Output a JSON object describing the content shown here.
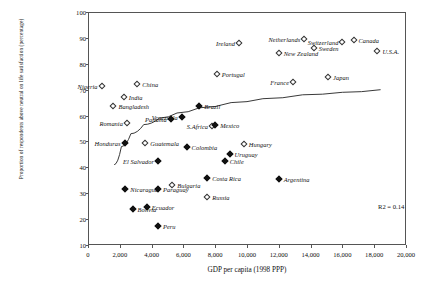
{
  "chart_data": {
    "type": "scatter",
    "title": "",
    "xlabel": "GDP per capita (1998 PPP)",
    "ylabel": "Proportion of respondents above neutral on life satisfaction (percentage)",
    "xlim": [
      0,
      20000
    ],
    "ylim": [
      10,
      100
    ],
    "xticks": [
      "0",
      "2,000",
      "4,000",
      "6,000",
      "8,000",
      "10,000",
      "12,000",
      "14,000",
      "16,000",
      "18,000",
      "20,000"
    ],
    "xtick_values": [
      0,
      2000,
      4000,
      6000,
      8000,
      10000,
      12000,
      14000,
      16000,
      18000,
      20000
    ],
    "yticks": [
      "10",
      "20",
      "30",
      "40",
      "50",
      "60",
      "70",
      "80",
      "90",
      "100"
    ],
    "ytick_values": [
      10,
      20,
      30,
      40,
      50,
      60,
      70,
      80,
      90,
      100
    ],
    "grid": false,
    "legend": "none",
    "annotation": "R2 = 0.14",
    "fit": {
      "type": "logarithmic",
      "description": "rising log curve flattening at high GDP",
      "points": [
        [
          1650,
          41
        ],
        [
          2100,
          48
        ],
        [
          2700,
          53
        ],
        [
          3500,
          56.5
        ],
        [
          4500,
          59
        ],
        [
          5600,
          61
        ],
        [
          7000,
          63
        ],
        [
          9000,
          65
        ],
        [
          11000,
          66.5
        ],
        [
          13500,
          68
        ],
        [
          16000,
          69
        ],
        [
          18400,
          70
        ]
      ]
    },
    "marker_styles": {
      "hollow": "non Latin-American country (open diamond)",
      "filled": "Latin-American country (filled diamond)"
    },
    "points": [
      {
        "name": "Nigeria",
        "x": 850,
        "y": 71.5,
        "marker": "hollow",
        "label_side": "r"
      },
      {
        "name": "China",
        "x": 3100,
        "y": 72.0,
        "marker": "hollow",
        "label_side": "l"
      },
      {
        "name": "India",
        "x": 2250,
        "y": 67.0,
        "marker": "hollow",
        "label_side": "l"
      },
      {
        "name": "Bangladesh",
        "x": 1600,
        "y": 63.5,
        "marker": "hollow",
        "label_side": "l"
      },
      {
        "name": "Romania",
        "x": 2450,
        "y": 57.0,
        "marker": "hollow",
        "label_side": "r"
      },
      {
        "name": "S.Africa",
        "x": 7800,
        "y": 56.0,
        "marker": "hollow",
        "label_side": "r"
      },
      {
        "name": "Honduras",
        "x": 2300,
        "y": 49.5,
        "marker": "filled",
        "label_side": "r"
      },
      {
        "name": "Guatemala",
        "x": 3600,
        "y": 49.5,
        "marker": "hollow",
        "label_side": "l"
      },
      {
        "name": "Hungary",
        "x": 9800,
        "y": 49.0,
        "marker": "hollow",
        "label_side": "l"
      },
      {
        "name": "Panama",
        "x": 5200,
        "y": 58.5,
        "marker": "filled",
        "label_side": "r"
      },
      {
        "name": "Venezuela",
        "x": 5900,
        "y": 59.5,
        "marker": "filled",
        "label_side": "r"
      },
      {
        "name": "Brazil",
        "x": 7000,
        "y": 63.5,
        "marker": "filled",
        "label_side": "l"
      },
      {
        "name": "Mexico",
        "x": 8000,
        "y": 56.5,
        "marker": "filled",
        "label_side": "l"
      },
      {
        "name": "Colombia",
        "x": 6200,
        "y": 48.0,
        "marker": "filled",
        "label_side": "l"
      },
      {
        "name": "Uruguay",
        "x": 8900,
        "y": 45.0,
        "marker": "filled",
        "label_side": "l"
      },
      {
        "name": "Chile",
        "x": 8600,
        "y": 42.5,
        "marker": "filled",
        "label_side": "l"
      },
      {
        "name": "El Salvador",
        "x": 4400,
        "y": 42.5,
        "marker": "filled",
        "label_side": "r"
      },
      {
        "name": "Costa Rica",
        "x": 7500,
        "y": 36.0,
        "marker": "filled",
        "label_side": "l"
      },
      {
        "name": "Argentina",
        "x": 12000,
        "y": 35.5,
        "marker": "filled",
        "label_side": "l"
      },
      {
        "name": "Nicaragua",
        "x": 2350,
        "y": 31.5,
        "marker": "filled",
        "label_side": "l"
      },
      {
        "name": "Paraguay",
        "x": 4400,
        "y": 31.5,
        "marker": "filled",
        "label_side": "l"
      },
      {
        "name": "Bulgaria",
        "x": 5300,
        "y": 33.0,
        "marker": "hollow",
        "label_side": "l"
      },
      {
        "name": "Russia",
        "x": 7500,
        "y": 28.5,
        "marker": "hollow",
        "label_side": "l"
      },
      {
        "name": "Bolivia",
        "x": 2800,
        "y": 24.0,
        "marker": "filled",
        "label_side": "l"
      },
      {
        "name": "Ecuador",
        "x": 3700,
        "y": 24.5,
        "marker": "filled",
        "label_side": "l"
      },
      {
        "name": "Peru",
        "x": 4400,
        "y": 17.5,
        "marker": "filled",
        "label_side": "l"
      },
      {
        "name": "Portugal",
        "x": 8100,
        "y": 76.0,
        "marker": "hollow",
        "label_side": "l"
      },
      {
        "name": "Ireland",
        "x": 9500,
        "y": 88.0,
        "marker": "hollow",
        "label_side": "r"
      },
      {
        "name": "New Zealand",
        "x": 12000,
        "y": 84.0,
        "marker": "hollow",
        "label_side": "l"
      },
      {
        "name": "Netherlands",
        "x": 13600,
        "y": 89.5,
        "marker": "hollow",
        "label_side": "r"
      },
      {
        "name": "Sweden",
        "x": 14200,
        "y": 86.0,
        "marker": "hollow",
        "label_side": "l"
      },
      {
        "name": "Switzerland",
        "x": 16000,
        "y": 88.5,
        "marker": "hollow",
        "label_side": "r"
      },
      {
        "name": "Canada",
        "x": 16700,
        "y": 89.0,
        "marker": "hollow",
        "label_side": "l"
      },
      {
        "name": "U.S.A.",
        "x": 18200,
        "y": 85.0,
        "marker": "hollow",
        "label_side": "l"
      },
      {
        "name": "Japan",
        "x": 15100,
        "y": 75.0,
        "marker": "hollow",
        "label_side": "l"
      },
      {
        "name": "France",
        "x": 12900,
        "y": 73.0,
        "marker": "hollow",
        "label_side": "r"
      }
    ]
  }
}
